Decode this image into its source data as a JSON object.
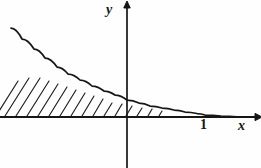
{
  "figure": {
    "title": "",
    "background_color": "#fefefe",
    "ink_color": "#161616"
  },
  "axes": {
    "x_axis": {
      "name": "x-axis",
      "label": "x",
      "label_x": 243,
      "label_y": 126,
      "start_x": 0,
      "end_x": 255,
      "y": 117,
      "arrow": "right",
      "arrow_size": 7
    },
    "y_axis": {
      "name": "y-axis",
      "label": "y",
      "label_x": 110,
      "label_y": 10,
      "x": 127,
      "start_y": 168,
      "end_y": 8,
      "arrow": "up",
      "arrow_size": 7
    }
  },
  "ticks": [
    {
      "name": "tick-one",
      "label": "1",
      "axis": "x",
      "value": 1,
      "pixel_x": 205,
      "label_x": 203,
      "label_y": 124
    }
  ],
  "chart_data": {
    "type": "line",
    "title": "",
    "xlabel": "x",
    "ylabel": "y",
    "curve_name": "exponential-decay-curve",
    "grid": false,
    "legend": false,
    "xlim": [
      -1.52,
      1.6
    ],
    "ylim": [
      0,
      2.1
    ],
    "x_origin_px": 127,
    "y_origin_px": 117,
    "px_per_unit_x": 78,
    "px_per_unit_y": 45,
    "x": [
      -1.49,
      -1.35,
      -1.2,
      -1.05,
      -0.9,
      -0.75,
      -0.6,
      -0.45,
      -0.3,
      -0.15,
      0.0,
      0.15,
      0.3,
      0.45,
      0.6,
      0.75,
      0.9,
      1.0,
      1.2,
      1.4,
      1.6
    ],
    "y": [
      1.98,
      1.73,
      1.5,
      1.3,
      1.12,
      0.96,
      0.82,
      0.7,
      0.59,
      0.49,
      0.38,
      0.31,
      0.25,
      0.2,
      0.16,
      0.13,
      0.1,
      0.07,
      0.04,
      0.02,
      0.0
    ],
    "points_px": [
      [
        11,
        28
      ],
      [
        22,
        39
      ],
      [
        34,
        49
      ],
      [
        45,
        58
      ],
      [
        57,
        67
      ],
      [
        68,
        74
      ],
      [
        80,
        80
      ],
      [
        92,
        86
      ],
      [
        104,
        91
      ],
      [
        115,
        95
      ],
      [
        127,
        100
      ],
      [
        139,
        103
      ],
      [
        150,
        106
      ],
      [
        162,
        108
      ],
      [
        174,
        110
      ],
      [
        185,
        112
      ],
      [
        197,
        113.5
      ],
      [
        205,
        115
      ],
      [
        221,
        116
      ],
      [
        237,
        116.8
      ],
      [
        252,
        117
      ]
    ]
  },
  "shaded_region": {
    "name": "hatched-area",
    "style": "diagonal-hatch",
    "angle_degrees": 58,
    "line_spacing_px": 11,
    "x_start_px": 0,
    "x_end_px": 166,
    "lines": [
      {
        "x1": -4,
        "y1": 116,
        "x2": 18,
        "y2": 81
      },
      {
        "x1": 5,
        "y1": 116,
        "x2": 29,
        "y2": 78
      },
      {
        "x1": 16,
        "y1": 116,
        "x2": 40,
        "y2": 78
      },
      {
        "x1": 27,
        "y1": 116,
        "x2": 49,
        "y2": 81
      },
      {
        "x1": 38,
        "y1": 116,
        "x2": 58,
        "y2": 84
      },
      {
        "x1": 49,
        "y1": 116,
        "x2": 67,
        "y2": 87
      },
      {
        "x1": 60,
        "y1": 116,
        "x2": 76,
        "y2": 90
      },
      {
        "x1": 71,
        "y1": 116,
        "x2": 85,
        "y2": 93
      },
      {
        "x1": 82,
        "y1": 116,
        "x2": 94,
        "y2": 96
      },
      {
        "x1": 93,
        "y1": 116,
        "x2": 103,
        "y2": 99
      },
      {
        "x1": 104,
        "y1": 116,
        "x2": 112,
        "y2": 103
      },
      {
        "x1": 115,
        "y1": 116,
        "x2": 122,
        "y2": 104
      },
      {
        "x1": 126,
        "y1": 116,
        "x2": 132,
        "y2": 106
      },
      {
        "x1": 137,
        "y1": 116,
        "x2": 142,
        "y2": 108
      },
      {
        "x1": 148,
        "y1": 116,
        "x2": 152,
        "y2": 109
      },
      {
        "x1": 159,
        "y1": 116,
        "x2": 162,
        "y2": 111
      }
    ]
  }
}
